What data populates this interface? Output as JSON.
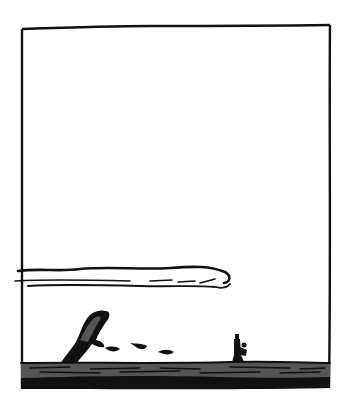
{
  "scene": {
    "type": "comic-panel",
    "description": "Wordless black-and-white comic panel: a tiny figure stands on the right of a dark sea horizon while a whale breaches on the left; a long streaky cloud stretches across the sky.",
    "elements": {
      "frame": "panel-border",
      "cloud": "long-streaky-cloud",
      "whale": "breaching-whale",
      "splashes": [
        "splash-1",
        "splash-2",
        "splash-3"
      ],
      "figure": "small-standing-person",
      "sea": "dark-sea-band"
    },
    "colors": {
      "ink": "#111111",
      "sea_gray": "#555555",
      "paper": "#ffffff"
    }
  }
}
